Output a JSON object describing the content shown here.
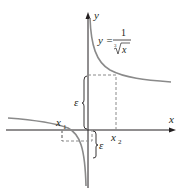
{
  "diagram": {
    "equation_lhs": "y =",
    "equation_num": "1",
    "equation_root_index": "3",
    "equation_radicand": "x",
    "axis_x_label": "x",
    "axis_y_label": "y",
    "x1_label": "x",
    "x1_sub": "1",
    "x2_label": "x",
    "x2_sub": "2",
    "epsilon_upper": "ε",
    "epsilon_lower": "ε",
    "colors": {
      "axis": "#231f20",
      "curve": "#8a8a8a",
      "dashed": "#8a8a8a"
    }
  }
}
